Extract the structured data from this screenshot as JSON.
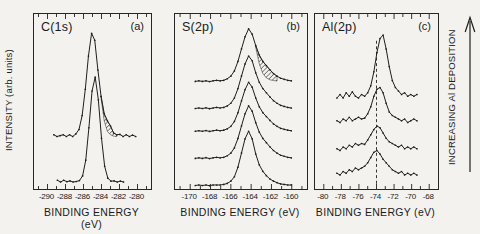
{
  "figure": {
    "ylabel": "INTENSITY (arb. units)",
    "right_label": "INCREASING Al DEPOSITION"
  },
  "colors": {
    "ink": "#1f1f1f",
    "paper": "#f3f2ef"
  },
  "chart_data": [
    {
      "id": "a",
      "type": "line",
      "title": "C(1s)",
      "panel_label": "(a)",
      "xlabel": "BINDING ENERGY (eV)",
      "ylabel": "INTENSITY (arb. units)",
      "xlim": [
        -291.5,
        -278.5
      ],
      "xticks": [
        -290,
        -288,
        -286,
        -284,
        -282,
        -280
      ],
      "grid": false,
      "series": [
        {
          "name": "s1",
          "x": [
            -289.3,
            -288.95,
            -288.6,
            -288.25,
            -287.9,
            -287.55,
            -287.2,
            -286.85,
            -286.5,
            -286.15,
            -285.8,
            -285.45,
            -285.1,
            -284.75,
            -284.4,
            -284.05,
            -283.7,
            -283.35,
            -283.0,
            -282.65,
            -282.3,
            -281.95,
            -281.6,
            -281.25,
            -280.9,
            -280.55,
            -280.2
          ],
          "y": [
            0.31,
            0.3,
            0.305,
            0.31,
            0.3,
            0.31,
            0.3,
            0.315,
            0.34,
            0.42,
            0.57,
            0.76,
            0.89,
            0.85,
            0.68,
            0.53,
            0.43,
            0.39,
            0.36,
            0.32,
            0.31,
            0.312,
            0.3,
            0.31,
            0.3,
            0.308,
            0.3
          ]
        },
        {
          "name": "s2",
          "x": [
            -288.9,
            -288.55,
            -288.2,
            -287.85,
            -287.5,
            -287.15,
            -286.8,
            -286.45,
            -286.1,
            -285.75,
            -285.4,
            -285.05,
            -284.7,
            -284.35,
            -284.0,
            -283.65,
            -283.3,
            -282.95,
            -282.6,
            -282.25,
            -281.9,
            -281.55
          ],
          "y": [
            0.05,
            0.04,
            0.05,
            0.042,
            0.046,
            0.04,
            0.043,
            0.048,
            0.075,
            0.165,
            0.35,
            0.56,
            0.64,
            0.51,
            0.29,
            0.13,
            0.062,
            0.045,
            0.046,
            0.04,
            0.045,
            0.04
          ]
        }
      ],
      "hatch": {
        "x": [
          -284.05,
          -283.7,
          -283.35,
          -283.0,
          -282.65,
          -282.3
        ],
        "top": [
          0.53,
          0.43,
          0.39,
          0.36,
          0.32,
          0.31
        ],
        "bottom": [
          0.52,
          0.39,
          0.33,
          0.31,
          0.302,
          0.3
        ]
      }
    },
    {
      "id": "b",
      "type": "line",
      "title": "S(2p)",
      "panel_label": "(b)",
      "xlabel": "BINDING ENERGY (eV)",
      "xlim": [
        -171.5,
        -158.5
      ],
      "xticks": [
        -170,
        -168,
        -166,
        -164,
        -162,
        -160
      ],
      "grid": false,
      "x": [
        -169.5,
        -169.15,
        -168.8,
        -168.45,
        -168.1,
        -167.75,
        -167.4,
        -167.05,
        -166.7,
        -166.35,
        -166.0,
        -165.65,
        -165.3,
        -164.95,
        -164.6,
        -164.25,
        -163.9,
        -163.55,
        -163.2,
        -162.85,
        -162.5,
        -162.15,
        -161.8,
        -161.45,
        -161.1,
        -160.75,
        -160.4,
        -160.05
      ],
      "series": [
        {
          "name": "s1",
          "y": [
            0.615,
            0.618,
            0.615,
            0.618,
            0.614,
            0.618,
            0.621,
            0.618,
            0.621,
            0.63,
            0.645,
            0.675,
            0.729,
            0.801,
            0.87,
            0.915,
            0.885,
            0.819,
            0.765,
            0.729,
            0.705,
            0.681,
            0.66,
            0.645,
            0.633,
            0.627,
            0.621,
            0.618
          ]
        },
        {
          "name": "s2",
          "y": [
            0.46,
            0.463,
            0.46,
            0.464,
            0.459,
            0.463,
            0.466,
            0.463,
            0.466,
            0.475,
            0.49,
            0.52,
            0.574,
            0.646,
            0.715,
            0.76,
            0.733,
            0.664,
            0.61,
            0.574,
            0.55,
            0.526,
            0.505,
            0.49,
            0.478,
            0.472,
            0.466,
            0.463
          ]
        },
        {
          "name": "s3",
          "y": [
            0.33,
            0.333,
            0.33,
            0.334,
            0.329,
            0.333,
            0.336,
            0.333,
            0.336,
            0.344,
            0.358,
            0.386,
            0.436,
            0.504,
            0.568,
            0.61,
            0.582,
            0.52,
            0.47,
            0.436,
            0.414,
            0.392,
            0.372,
            0.358,
            0.347,
            0.341,
            0.336,
            0.333
          ]
        },
        {
          "name": "s4",
          "y": [
            0.175,
            0.178,
            0.175,
            0.179,
            0.174,
            0.178,
            0.181,
            0.178,
            0.181,
            0.19,
            0.205,
            0.235,
            0.289,
            0.361,
            0.43,
            0.475,
            0.445,
            0.379,
            0.325,
            0.289,
            0.265,
            0.241,
            0.22,
            0.205,
            0.193,
            0.187,
            0.181,
            0.178
          ]
        },
        {
          "name": "s5",
          "y": [
            0.02,
            0.023,
            0.02,
            0.023,
            0.019,
            0.023,
            0.023,
            0.023,
            0.026,
            0.032,
            0.045,
            0.07,
            0.125,
            0.206,
            0.287,
            0.33,
            0.287,
            0.2,
            0.138,
            0.101,
            0.076,
            0.057,
            0.045,
            0.036,
            0.029,
            0.026,
            0.023,
            0.023
          ]
        }
      ],
      "hatch": {
        "x": [
          -163.55,
          -163.2,
          -162.85,
          -162.5,
          -162.15,
          -161.8,
          -161.45
        ],
        "top": [
          0.819,
          0.765,
          0.729,
          0.705,
          0.681,
          0.66,
          0.645
        ],
        "bottom": [
          0.809,
          0.715,
          0.66,
          0.635,
          0.624,
          0.62,
          0.617
        ]
      }
    },
    {
      "id": "c",
      "type": "line",
      "title": "Al(2p)",
      "panel_label": "(c)",
      "xlabel": "BINDING ENERGY (eV)",
      "xlim": [
        -81.0,
        -67.0
      ],
      "xticks": [
        -80,
        -78,
        -76,
        -74,
        -72,
        -70,
        -68
      ],
      "grid": false,
      "vline": {
        "x": -74,
        "y1": 0.03,
        "y2": 0.86,
        "style": "dashed"
      },
      "x": [
        -78.5,
        -78.15,
        -77.8,
        -77.45,
        -77.1,
        -76.75,
        -76.4,
        -76.05,
        -75.7,
        -75.35,
        -75.0,
        -74.65,
        -74.3,
        -73.95,
        -73.6,
        -73.25,
        -72.9,
        -72.55,
        -72.2,
        -71.85,
        -71.5,
        -71.15,
        -70.8,
        -70.45,
        -70.1,
        -69.75,
        -69.4
      ],
      "series": [
        {
          "name": "s1",
          "y": [
            0.52,
            0.54,
            0.52,
            0.55,
            0.53,
            0.555,
            0.53,
            0.52,
            0.54,
            0.53,
            0.55,
            0.59,
            0.67,
            0.78,
            0.86,
            0.88,
            0.8,
            0.7,
            0.62,
            0.58,
            0.56,
            0.54,
            0.55,
            0.53,
            0.54,
            0.53,
            0.54
          ]
        },
        {
          "name": "s2",
          "y": [
            0.39,
            0.38,
            0.4,
            0.39,
            0.41,
            0.39,
            0.4,
            0.41,
            0.4,
            0.405,
            0.43,
            0.47,
            0.53,
            0.57,
            0.58,
            0.55,
            0.49,
            0.44,
            0.42,
            0.41,
            0.4,
            0.39,
            0.4,
            0.38,
            0.39,
            0.4,
            0.39
          ]
        },
        {
          "name": "s3",
          "y": [
            0.23,
            0.22,
            0.24,
            0.23,
            0.25,
            0.24,
            0.26,
            0.25,
            0.26,
            0.255,
            0.28,
            0.31,
            0.34,
            0.36,
            0.35,
            0.32,
            0.29,
            0.27,
            0.26,
            0.25,
            0.24,
            0.25,
            0.23,
            0.24,
            0.23,
            0.24,
            0.23
          ]
        },
        {
          "name": "s4",
          "y": [
            0.09,
            0.08,
            0.1,
            0.09,
            0.11,
            0.1,
            0.12,
            0.11,
            0.12,
            0.13,
            0.15,
            0.18,
            0.21,
            0.22,
            0.2,
            0.17,
            0.15,
            0.13,
            0.11,
            0.1,
            0.09,
            0.1,
            0.08,
            0.09,
            0.08,
            0.09,
            0.08
          ]
        }
      ]
    }
  ]
}
